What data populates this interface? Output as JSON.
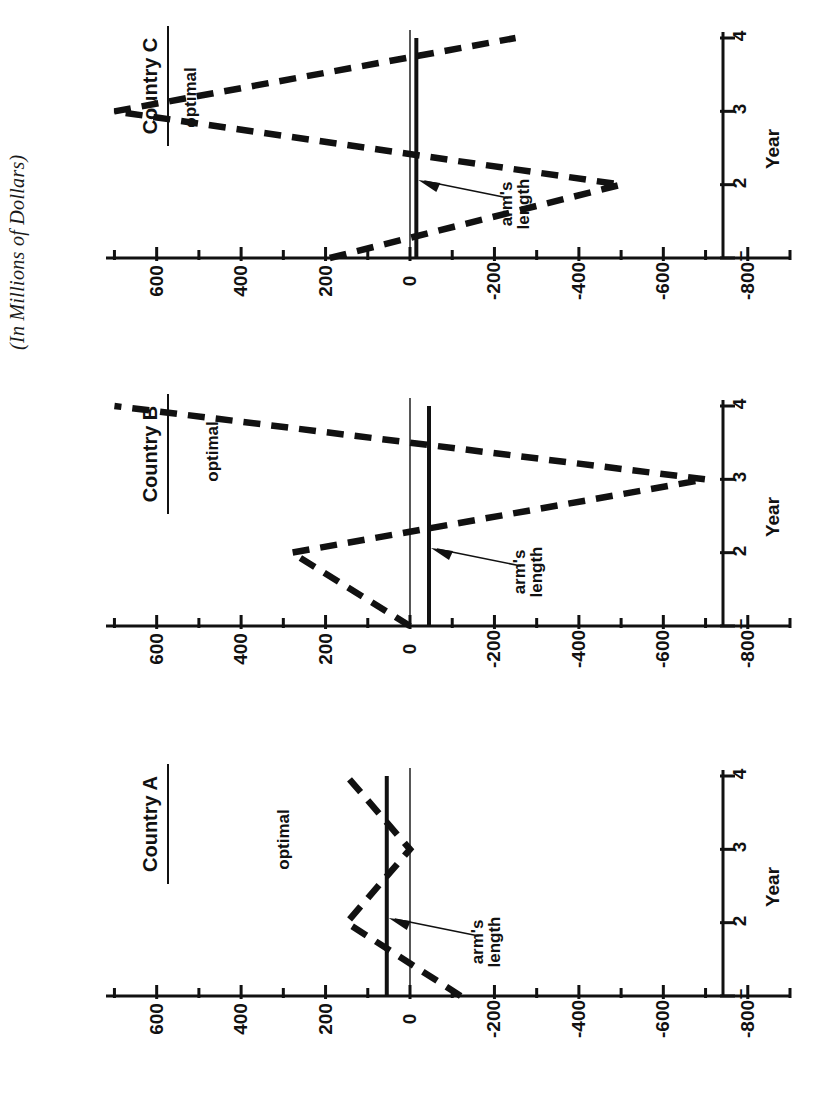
{
  "figure": {
    "units_note": "(In Millions of Dollars)",
    "orientation": "rotated-90-ccw",
    "panel_titles": [
      "Country A",
      "Country B",
      "Country C"
    ],
    "series_labels": {
      "optimal": "optimal",
      "arms_length_line1": "arm's",
      "arms_length_line2": "length"
    },
    "axis": {
      "x_name": "Year",
      "x_ticks": [
        "1",
        "2",
        "3",
        "4"
      ],
      "y_ticks": [
        "600",
        "400",
        "200",
        "0",
        "-200",
        "-400",
        "-600",
        "-800"
      ]
    },
    "colors": {
      "ink": "#111111",
      "paper": "#ffffff"
    }
  },
  "chart_data": {
    "type": "line",
    "title": "(In Millions of Dollars)",
    "xlabel": "Year",
    "ylabel": "(In Millions of Dollars)",
    "x": [
      1,
      2,
      3,
      4
    ],
    "xlim": [
      0.72,
      4.25
    ],
    "ylim": [
      -900,
      720
    ],
    "yticks": [
      600,
      400,
      200,
      0,
      -200,
      -400,
      -600,
      -800
    ],
    "yticks_minor": [
      700,
      500,
      300,
      100,
      -100,
      -300,
      -500,
      -700,
      -900
    ],
    "grid": false,
    "legend": "inline-annotations",
    "panels": [
      {
        "name": "Country A",
        "series": [
          {
            "name": "optimal",
            "style": "dashed",
            "values": [
              -120,
              150,
              0,
              150
            ]
          },
          {
            "name": "arm's length",
            "style": "solid-bold",
            "values": [
              55,
              55,
              55,
              55
            ]
          }
        ]
      },
      {
        "name": "Country B",
        "series": [
          {
            "name": "optimal",
            "style": "dashed",
            "values": [
              0,
              280,
              -700,
              700
            ]
          },
          {
            "name": "arm's length",
            "style": "solid-bold",
            "values": [
              -45,
              -45,
              -45,
              -45
            ]
          }
        ]
      },
      {
        "name": "Country C",
        "series": [
          {
            "name": "optimal",
            "style": "dashed",
            "values": [
              190,
              -500,
              700,
              -250
            ]
          },
          {
            "name": "arm's length",
            "style": "solid-bold",
            "values": [
              -15,
              -15,
              -15,
              -15
            ]
          }
        ]
      }
    ]
  }
}
